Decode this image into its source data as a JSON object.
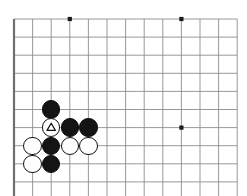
{
  "diagram": {
    "kind": "go-board-diagram",
    "colors": {
      "background": "#ffffff",
      "grid_line": "#8d8d8d",
      "border_line": "#6f6f6f",
      "black_stone": "#141414",
      "white_stone": "#fefefe",
      "stone_outline": "#121212",
      "star_point": "#1a1a1a",
      "mark": "#111111"
    },
    "board": {
      "left": 14,
      "top": 19,
      "spacing_x": 18.6,
      "spacing_y": 18.1,
      "cols": 12,
      "rows": 10,
      "grid_visible": true
    },
    "star_points": [
      {
        "name": "star-point-top-left",
        "col": 3,
        "row": 0
      },
      {
        "name": "star-point-top-right",
        "col": 9,
        "row": 0
      },
      {
        "name": "star-point-right",
        "col": 9,
        "row": 6
      }
    ],
    "stones": [
      {
        "name": "stone-black-1",
        "color": "black",
        "col": 2,
        "row": 5,
        "label": "",
        "mark": "none"
      },
      {
        "name": "stone-white-triangle",
        "color": "white",
        "col": 2,
        "row": 6,
        "label": "",
        "mark": "triangle"
      },
      {
        "name": "stone-black-2",
        "color": "black",
        "col": 3,
        "row": 6,
        "label": "",
        "mark": "none"
      },
      {
        "name": "stone-black-3",
        "color": "black",
        "col": 4,
        "row": 6,
        "label": "",
        "mark": "none"
      },
      {
        "name": "stone-white-1",
        "color": "white",
        "col": 1,
        "row": 7,
        "label": "",
        "mark": "none"
      },
      {
        "name": "stone-black-4",
        "color": "black",
        "col": 2,
        "row": 7,
        "label": "",
        "mark": "none"
      },
      {
        "name": "stone-white-2",
        "color": "white",
        "col": 3,
        "row": 7,
        "label": "",
        "mark": "none"
      },
      {
        "name": "stone-white-3",
        "color": "white",
        "col": 4,
        "row": 7,
        "label": "",
        "mark": "none"
      },
      {
        "name": "stone-white-4",
        "color": "white",
        "col": 1,
        "row": 8,
        "label": "",
        "mark": "none"
      },
      {
        "name": "stone-black-5",
        "color": "black",
        "col": 2,
        "row": 8,
        "label": "",
        "mark": "none"
      }
    ],
    "stone_radius": 9.2,
    "star_radius": 2.1,
    "counts": {
      "black_stones": 5,
      "white_stones": 5,
      "marked_stones": 1
    }
  }
}
